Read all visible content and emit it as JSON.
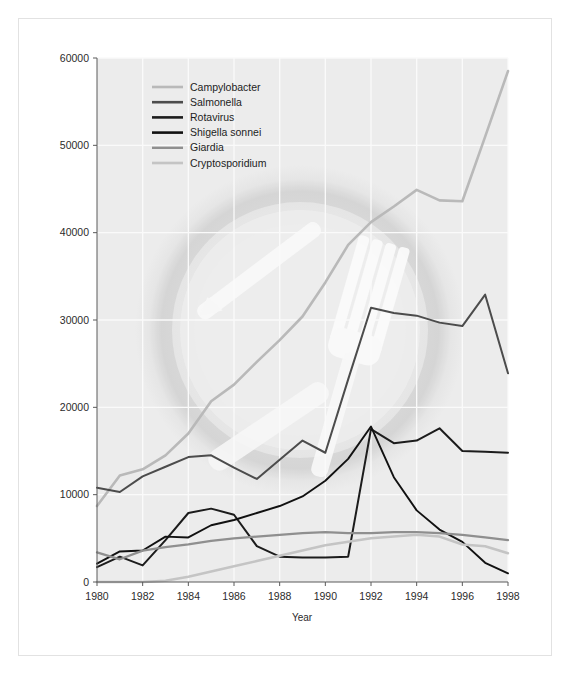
{
  "figure": {
    "background_color": "#ffffff",
    "border_color": "#e3e3e3",
    "plot_background_color": "#ececec",
    "gridline_color": "#fafafa",
    "axis_color": "#555555",
    "watermark": "fork-knife-plate-photo"
  },
  "chart_data": {
    "type": "line",
    "title": "",
    "subtitle": "",
    "xlabel": "Year",
    "ylabel": "",
    "xlim": [
      1980,
      1998
    ],
    "ylim": [
      0,
      60000
    ],
    "ytick_step": 10000,
    "xtick_step": 2,
    "grid": true,
    "legend_position": "top-left-inside",
    "x": [
      1980,
      1981,
      1982,
      1983,
      1984,
      1985,
      1986,
      1987,
      1988,
      1989,
      1990,
      1991,
      1992,
      1993,
      1994,
      1995,
      1996,
      1997,
      1998
    ],
    "xticklabels": [
      "1980",
      "1982",
      "1984",
      "1986",
      "1988",
      "1990",
      "1992",
      "1994",
      "1996",
      "1998"
    ],
    "yticklabels": [
      "0",
      "10000",
      "20000",
      "30000",
      "40000",
      "50000",
      "60000"
    ],
    "series": [
      {
        "name": "Campylobacter",
        "color": "#b9b9b9",
        "width": 2.6,
        "values": [
          8700,
          12200,
          12900,
          14500,
          17000,
          20700,
          22600,
          25200,
          27700,
          30400,
          34300,
          38600,
          41200,
          43000,
          44900,
          43700,
          43600,
          51000,
          58500
        ]
      },
      {
        "name": "Salmonella",
        "color": "#4c4c4c",
        "width": 2.0,
        "values": [
          10800,
          10300,
          12100,
          13200,
          14300,
          14500,
          13100,
          11800,
          14000,
          16200,
          14800,
          23200,
          31400,
          30800,
          30500,
          29700,
          29300,
          32900,
          23900
        ]
      },
      {
        "name": "Rotavirus",
        "color": "#1c1c1c",
        "width": 2.0,
        "values": [
          1700,
          2900,
          1900,
          4800,
          7900,
          8400,
          7700,
          4100,
          2900,
          2800,
          2800,
          2900,
          17500,
          15900,
          16200,
          17600,
          15000,
          14900,
          14800
        ]
      },
      {
        "name": "Shigella sonnei",
        "color": "#111111",
        "width": 1.9,
        "values": [
          2100,
          3500,
          3600,
          5200,
          5100,
          6500,
          7100,
          7900,
          8700,
          9800,
          11600,
          14100,
          17800,
          12000,
          8200,
          6000,
          4600,
          2200,
          1000
        ]
      },
      {
        "name": "Giardia",
        "color": "#8f8f8f",
        "width": 2.3,
        "values": [
          3400,
          2600,
          3600,
          4000,
          4300,
          4700,
          5000,
          5200,
          5400,
          5600,
          5700,
          5600,
          5600,
          5700,
          5700,
          5600,
          5400,
          5100,
          4800
        ]
      },
      {
        "name": "Cryptosporidium",
        "color": "#c4c4c4",
        "width": 2.5,
        "values": [
          0,
          0,
          0,
          150,
          600,
          1200,
          1800,
          2400,
          3000,
          3600,
          4200,
          4600,
          5000,
          5200,
          5400,
          5200,
          4300,
          4100,
          3300
        ]
      }
    ]
  },
  "legend": {
    "entries": [
      {
        "label": "Campylobacter",
        "color": "#b9b9b9"
      },
      {
        "label": "Salmonella",
        "color": "#4c4c4c"
      },
      {
        "label": "Rotavirus",
        "color": "#1c1c1c"
      },
      {
        "label": "Shigella sonnei",
        "color": "#111111"
      },
      {
        "label": "Giardia",
        "color": "#8f8f8f"
      },
      {
        "label": "Cryptosporidium",
        "color": "#c4c4c4"
      }
    ]
  }
}
